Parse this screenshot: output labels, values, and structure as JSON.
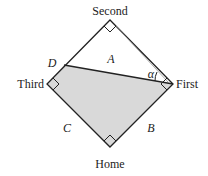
{
  "diagram": {
    "type": "baseball-diamond",
    "labels": {
      "second": "Second",
      "first": "First",
      "third": "Third",
      "home": "Home",
      "point_d": "D",
      "region_a": "A",
      "side_b": "B",
      "side_c": "C",
      "angle": "α"
    },
    "colors": {
      "line": "#222222",
      "shaded_region": "#d9d9d9",
      "background": "#ffffff"
    }
  }
}
